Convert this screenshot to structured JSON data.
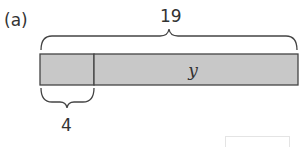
{
  "diagram": {
    "part_label": "(a)",
    "total": "19",
    "segments": [
      {
        "label": "",
        "value": "4"
      },
      {
        "label": "y",
        "value": ""
      }
    ],
    "known_part": "4",
    "unknown_part": "y",
    "colors": {
      "bar_fill": "#c8c8c8",
      "bar_stroke": "#444444",
      "brace": "#444444",
      "text": "#333333"
    }
  }
}
